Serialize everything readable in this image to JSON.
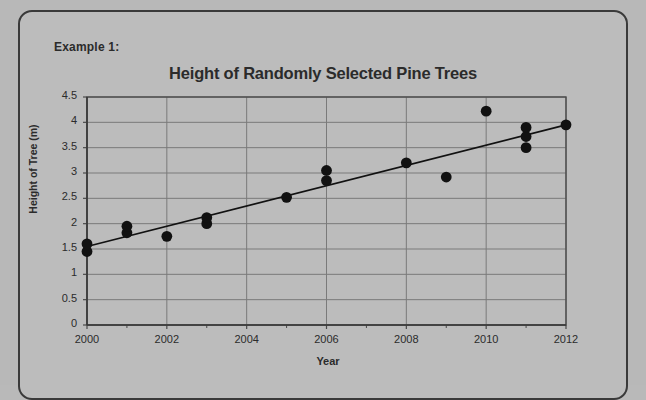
{
  "panel": {
    "example_label": "Example 1:"
  },
  "chart_data": {
    "type": "scatter",
    "title": "Height of Randomly Selected Pine Trees",
    "xlabel": "Year",
    "ylabel": "Height of Tree (m)",
    "xlim": [
      2000,
      2012
    ],
    "ylim": [
      0,
      4.5
    ],
    "grid": true,
    "legend": "none",
    "x_ticks": [
      2000,
      2002,
      2004,
      2006,
      2008,
      2010,
      2012
    ],
    "x_tick_labels": [
      "2000",
      "2002",
      "2004",
      "2006",
      "2008",
      "2010",
      "2012"
    ],
    "x_minor_ticks": [
      2001,
      2003,
      2005,
      2007,
      2009,
      2011
    ],
    "y_ticks": [
      0,
      0.5,
      1,
      1.5,
      2,
      2.5,
      3,
      3.5,
      4,
      4.5
    ],
    "y_tick_labels": [
      "0",
      "0.5",
      "1",
      "1.5",
      "2",
      "2.5",
      "3",
      "3.5",
      "4",
      "4.5"
    ],
    "points": [
      {
        "x": 2000,
        "y": 1.45
      },
      {
        "x": 2000,
        "y": 1.6
      },
      {
        "x": 2001,
        "y": 1.82
      },
      {
        "x": 2001,
        "y": 1.95
      },
      {
        "x": 2002,
        "y": 1.75
      },
      {
        "x": 2003,
        "y": 2.0
      },
      {
        "x": 2003,
        "y": 2.12
      },
      {
        "x": 2005,
        "y": 2.52
      },
      {
        "x": 2006,
        "y": 2.85
      },
      {
        "x": 2006,
        "y": 3.05
      },
      {
        "x": 2008,
        "y": 3.2
      },
      {
        "x": 2009,
        "y": 2.92
      },
      {
        "x": 2010,
        "y": 4.22
      },
      {
        "x": 2011,
        "y": 3.5
      },
      {
        "x": 2011,
        "y": 3.72
      },
      {
        "x": 2011,
        "y": 3.9
      },
      {
        "x": 2012,
        "y": 3.95
      }
    ],
    "trend_line": {
      "name": "line of best fit",
      "start": {
        "x": 2000,
        "y": 1.55
      },
      "end": {
        "x": 2012,
        "y": 3.95
      }
    },
    "marker_color": "#111111",
    "line_color": "#111111",
    "grid_color": "#7a7a7a",
    "axis_color": "#4a4a4a",
    "plot_background": "#bcbcbc"
  }
}
